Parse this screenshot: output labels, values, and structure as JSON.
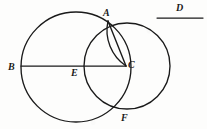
{
  "figure": {
    "kind": "geometry-diagram",
    "canvas": {
      "width": 207,
      "height": 129
    },
    "ink_color": "#1a1a1a",
    "background_color": "#fdfdfc",
    "stroke_width": 1.3,
    "shapes": {
      "left_circle": {
        "name": "large-circle",
        "cx": 76,
        "cy": 67,
        "r": 55
      },
      "right_circle": {
        "name": "small-circle",
        "cx": 127,
        "cy": 66,
        "r": 43
      },
      "diameter_line": {
        "name": "segment-BC",
        "x1": 21,
        "y1": 66,
        "x2": 126,
        "y2": 66
      },
      "chord_AC": {
        "name": "segment-AC",
        "x1": 108,
        "y1": 21,
        "x2": 126,
        "y2": 66
      },
      "sliver_arc": {
        "name": "arc-AC-sliver",
        "x1": 108,
        "y1": 21,
        "x2": 126,
        "y2": 66,
        "rx": 43,
        "ry": 43
      },
      "reference_segment_D": {
        "name": "segment-D",
        "x1": 157,
        "y1": 18,
        "x2": 203,
        "y2": 18
      }
    },
    "points": [
      {
        "label": "A",
        "role": "upper-intersection",
        "x": 108,
        "y": 21,
        "label_x": 103,
        "label_y": 8
      },
      {
        "label": "B",
        "role": "left-endpoint-of-diameter",
        "x": 21,
        "y": 66,
        "label_x": 8,
        "label_y": 62
      },
      {
        "label": "C",
        "role": "right-endpoint-of-diameter",
        "x": 126,
        "y": 66,
        "label_x": 128,
        "label_y": 60
      },
      {
        "label": "D",
        "role": "reference-segment-label",
        "x": 180,
        "y": 18,
        "label_x": 176,
        "label_y": 3
      },
      {
        "label": "E",
        "role": "center-of-large-circle",
        "x": 76,
        "y": 66,
        "label_x": 71,
        "label_y": 68
      },
      {
        "label": "F",
        "role": "lower-intersection",
        "x": 110,
        "y": 107,
        "label_x": 121,
        "label_y": 113
      }
    ]
  }
}
